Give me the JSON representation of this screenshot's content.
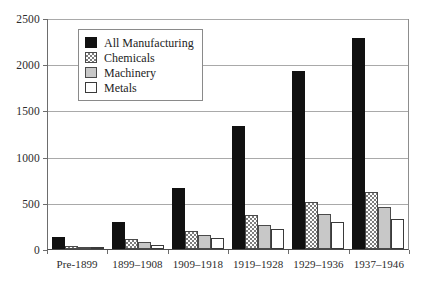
{
  "chart_data": {
    "type": "bar",
    "title": "",
    "xlabel": "",
    "ylabel": "",
    "ylim": [
      0,
      2500
    ],
    "yticks": [
      0,
      500,
      1000,
      1500,
      2000,
      2500
    ],
    "grid": true,
    "legend_position": "upper-left-inside",
    "categories": [
      "Pre-1899",
      "1899–1908",
      "1909–1918",
      "1919–1928",
      "1929–1936",
      "1937–1946"
    ],
    "series": [
      {
        "name": "All Manufacturing",
        "fill": "solid-black",
        "values": [
          130,
          290,
          660,
          1335,
          1930,
          2285
        ]
      },
      {
        "name": "Chemicals",
        "fill": "checkered",
        "values": [
          30,
          110,
          195,
          370,
          510,
          620
        ]
      },
      {
        "name": "Machinery",
        "fill": "gray",
        "values": [
          25,
          75,
          150,
          260,
          375,
          455
        ]
      },
      {
        "name": "Metals",
        "fill": "white",
        "values": [
          15,
          45,
          115,
          215,
          295,
          325
        ]
      }
    ]
  },
  "legend": {
    "items": [
      {
        "label": "All Manufacturing"
      },
      {
        "label": "Chemicals"
      },
      {
        "label": "Machinery"
      },
      {
        "label": "Metals"
      }
    ]
  },
  "colors": {
    "series_all_manufacturing": "#111111",
    "series_chemicals": "#7d7d7d",
    "series_machinery": "#c8c8c8",
    "series_metals": "#ffffff",
    "gridline": "#a9a9a9",
    "axis": "#4a4a4a",
    "text": "#2b2b2b"
  }
}
